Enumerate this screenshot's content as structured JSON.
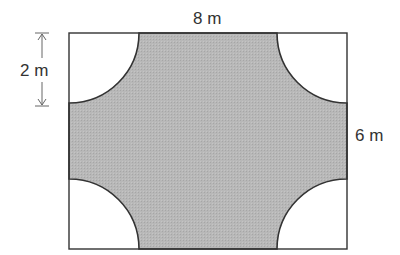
{
  "diagram": {
    "type": "geometry",
    "rectangle": {
      "width_label": "8 m",
      "height_label": "6 m"
    },
    "quarter_circle": {
      "radius_label": "2 m",
      "count": 4
    },
    "labels": {
      "top": "8 m",
      "right": "6 m",
      "left_dimension": "2 m"
    },
    "colors": {
      "shaded": "#b4b4b4",
      "outline": "#333333",
      "cutout": "#ffffff"
    }
  }
}
